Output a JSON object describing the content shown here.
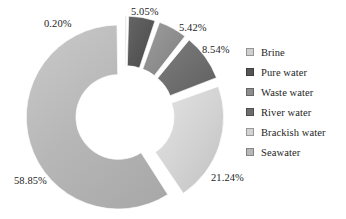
{
  "chart_data": {
    "type": "pie",
    "subtype": "doughnut-exploded",
    "title": "",
    "categories": [
      "Brine",
      "Pure water",
      "Waste water",
      "River water",
      "Brackish water",
      "Seawater"
    ],
    "values": [
      0.2,
      5.05,
      5.42,
      8.54,
      21.24,
      58.85
    ],
    "value_labels": [
      "0.20%",
      "5.05%",
      "5.42%",
      "8.54%",
      "21.24%",
      "58.85%"
    ],
    "colors": [
      "#cfcfcf",
      "#565656",
      "#8d8d8d",
      "#6d6d6d",
      "#d2d2d2",
      "#b7b7b7"
    ],
    "units": "percent",
    "total": 99.3,
    "start_angle_deg": 0,
    "direction": "clockwise",
    "inner_radius_ratio": 0.46,
    "legend_position": "right",
    "grid": false,
    "xlabel": "",
    "ylabel": ""
  },
  "labels": [
    {
      "text": "0.20%",
      "x": 44,
      "y": 18
    },
    {
      "text": "5.05%",
      "x": 131,
      "y": 6
    },
    {
      "text": "5.42%",
      "x": 179,
      "y": 22
    },
    {
      "text": "8.54%",
      "x": 202,
      "y": 44
    },
    {
      "text": "21.24%",
      "x": 211,
      "y": 172
    },
    {
      "text": "58.85%",
      "x": 14,
      "y": 175
    }
  ],
  "legend": {
    "items": [
      {
        "label": "Brine",
        "color": "#cfcfcf"
      },
      {
        "label": "Pure water",
        "color": "#565656"
      },
      {
        "label": "Waste water",
        "color": "#8d8d8d"
      },
      {
        "label": "River water",
        "color": "#6d6d6d"
      },
      {
        "label": "Brackish water",
        "color": "#d2d2d2"
      },
      {
        "label": "Seawater",
        "color": "#b7b7b7"
      }
    ]
  }
}
